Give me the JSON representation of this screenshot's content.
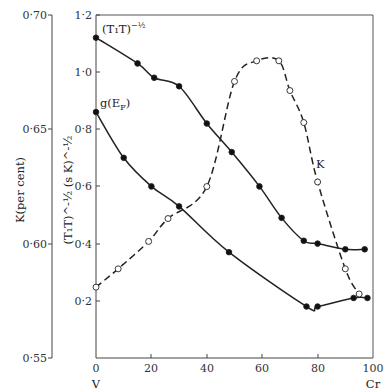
{
  "chart_data": {
    "type": "line",
    "title": "",
    "xlabel": "",
    "x_end_labels": {
      "left": "V",
      "right": "Cr"
    },
    "x_ticks": [
      "0",
      "20",
      "40",
      "60",
      "80",
      "100"
    ],
    "xlim": [
      0,
      100
    ],
    "left_axis": {
      "label": "K(per cent)",
      "ticks": [
        "0·70",
        "0·65",
        "0·60",
        "0·55"
      ],
      "ylim": [
        0.55,
        0.7
      ]
    },
    "inner_axis": {
      "label": "(T₁T)^-½ (s K)^-½",
      "ticks": [
        "1·2",
        "1·0",
        "0·8",
        "0·6",
        "0·4",
        "0·2"
      ],
      "ylim": [
        0,
        1.2
      ]
    },
    "series": [
      {
        "name": "(T₁T)^-½",
        "axis": "inner",
        "style": "solid, filled circles",
        "x": [
          0,
          15,
          21,
          30,
          40,
          49,
          59,
          67,
          75,
          80,
          90,
          97
        ],
        "y": [
          1.12,
          1.03,
          0.98,
          0.95,
          0.82,
          0.72,
          0.6,
          0.49,
          0.41,
          0.4,
          0.38,
          0.38
        ]
      },
      {
        "name": "g(E_F)",
        "axis": "inner",
        "style": "solid, filled circles",
        "x": [
          0,
          10,
          20,
          30,
          48,
          76,
          80,
          93,
          98
        ],
        "y": [
          0.86,
          0.7,
          0.6,
          0.53,
          0.37,
          0.18,
          0.18,
          0.21,
          0.21
        ]
      },
      {
        "name": "K",
        "axis": "left",
        "style": "dashed, open circles",
        "x": [
          0,
          8,
          19,
          26,
          40,
          50,
          58,
          66,
          70,
          75,
          80,
          90,
          95
        ],
        "y": [
          0.581,
          0.589,
          0.601,
          0.611,
          0.625,
          0.671,
          0.68,
          0.68,
          0.667,
          0.653,
          0.627,
          0.589,
          0.578
        ]
      }
    ],
    "annotations": {
      "t1t_label": "(T₁T)",
      "t1t_exp": "−½",
      "g_label": "g(E",
      "g_sub": "F",
      "g_close": ")",
      "k_label": "K"
    },
    "grid": false,
    "legend": "inline labels"
  }
}
